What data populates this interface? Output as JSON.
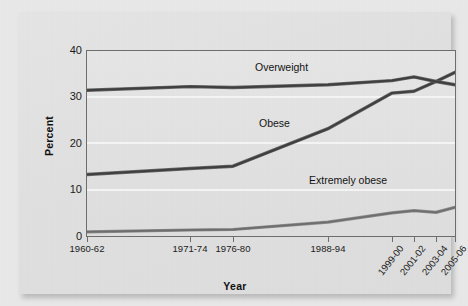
{
  "figure": {
    "x_axis_title": "Year",
    "y_axis_title": "Percent"
  },
  "chart_data": {
    "type": "line",
    "title": "",
    "subtitle": "",
    "xlabel": "Year",
    "ylabel": "Percent",
    "grid": true,
    "legend_position": "inline-annotations",
    "ylim": [
      0,
      40
    ],
    "yticks": [
      0,
      10,
      20,
      30,
      40
    ],
    "categories": [
      "1960-62",
      "1971-74",
      "1976-80",
      "1988-94",
      "1999-00",
      "2001-02",
      "2003-04",
      "2005-06"
    ],
    "series": [
      {
        "name": "Overweight",
        "color": "#4a4a4a",
        "values": [
          31.5,
          32.3,
          32.1,
          32.7,
          33.6,
          34.4,
          33.4,
          32.7
        ]
      },
      {
        "name": "Obese",
        "color": "#4a4a4a",
        "values": [
          13.3,
          14.6,
          15.1,
          23.2,
          30.9,
          31.3,
          33.4,
          35.4
        ]
      },
      {
        "name": "Extremely obese",
        "color": "#7a7a7a",
        "values": [
          0.9,
          1.3,
          1.4,
          3.0,
          5.0,
          5.5,
          5.1,
          6.2
        ]
      }
    ],
    "annotations": [
      {
        "text": "Overweight",
        "series": "Overweight"
      },
      {
        "text": "Obese",
        "series": "Obese"
      },
      {
        "text": "Extremely obese",
        "series": "Extremely obese"
      }
    ]
  },
  "yticks": {
    "t0": "0",
    "t10": "10",
    "t20": "20",
    "t30": "30",
    "t40": "40"
  },
  "xticks": {
    "x0": "1960-62",
    "x1": "1971-74",
    "x2": "1976-80",
    "x3": "1988-94",
    "x4": "1999-00",
    "x5": "2001-02",
    "x6": "2003-04",
    "x7": "2005-06"
  },
  "series_labels": {
    "overweight": "Overweight",
    "obese": "Obese",
    "extremely_obese": "Extremely obese"
  },
  "colors": {
    "line_dark": "#4a4a4a",
    "line_light": "#7a7a7a",
    "axis": "#6e6e6e",
    "plot_bg": "#e4e4e4",
    "panel_bg": "#e3e3e3",
    "page_bg": "#e9e9e9",
    "gridline": "#f6f6f6"
  }
}
